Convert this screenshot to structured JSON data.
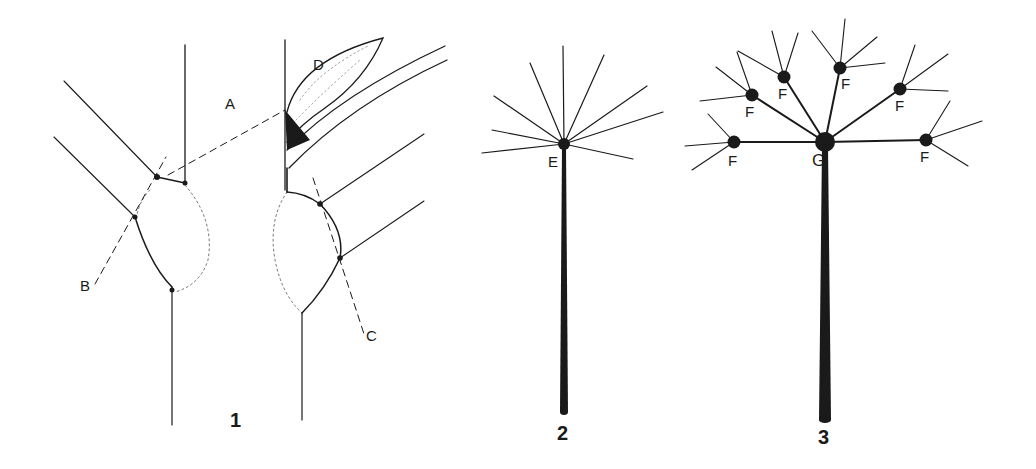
{
  "figures": [
    {
      "number": "1",
      "description": "Two views of a node with leaf sheath and bud",
      "labels": [
        "A",
        "B",
        "C",
        "D"
      ]
    },
    {
      "number": "2",
      "description": "Simple umbel with rays from a single point",
      "labels": [
        "E"
      ]
    },
    {
      "number": "3",
      "description": "Compound umbel with umbellets",
      "labels": [
        "G",
        "F",
        "F",
        "F",
        "F",
        "F",
        "F"
      ]
    }
  ],
  "labels": {
    "A": "A",
    "B": "B",
    "C": "C",
    "D": "D",
    "E": "E",
    "F": "F",
    "G": "G"
  },
  "fig_numbers": {
    "one": "1",
    "two": "2",
    "three": "3"
  },
  "colors": {
    "ink": "#1a1a1a",
    "background": "#ffffff"
  }
}
